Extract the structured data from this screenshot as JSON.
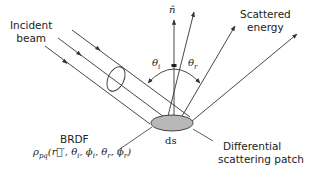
{
  "labels": {
    "incident": [
      "Incident",
      "beam"
    ],
    "scattered": [
      "Scattered",
      "energy"
    ],
    "brdf_title": "BRDF",
    "brdf_formula": "ρpq(r′, θi, ϕi, θr, ϕr)",
    "patch": [
      "Differential",
      "scattering patch"
    ],
    "ds": "ds",
    "normal": "n̂",
    "theta_i": "θi",
    "theta_r": "θr"
  },
  "colors": {
    "line": "#333333",
    "patch_fill": "#b8b8b8",
    "text": "#222222"
  }
}
